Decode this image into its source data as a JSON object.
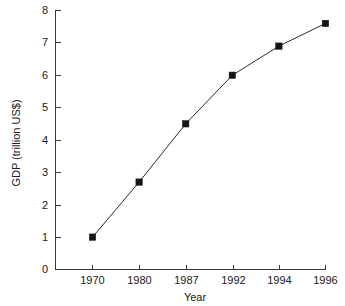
{
  "chart_data": {
    "type": "line",
    "title": "",
    "xlabel": "Year",
    "ylabel": "GDP (trillion US$)",
    "categories": [
      "1970",
      "1980",
      "1987",
      "1992",
      "1994",
      "1996"
    ],
    "values": [
      1.0,
      2.7,
      4.5,
      6.0,
      6.9,
      7.6
    ],
    "series": [
      {
        "name": "GDP",
        "values": [
          1.0,
          2.7,
          4.5,
          6.0,
          6.9,
          7.6
        ]
      }
    ],
    "x_tick_labels": [
      "1970",
      "1980",
      "1987",
      "1992",
      "1994",
      "1996"
    ],
    "y_tick_labels": [
      "0",
      "1",
      "2",
      "3",
      "4",
      "5",
      "6",
      "7",
      "8"
    ],
    "y_ticks": [
      0,
      1,
      2,
      3,
      4,
      5,
      6,
      7,
      8
    ],
    "ylim": [
      0,
      8
    ],
    "grid": false,
    "legend": false,
    "marker": "filled-square",
    "line_color": "#2b2b2b",
    "marker_color": "#151515",
    "axis_color": "#3a3a3a",
    "background_color": "#ffffff"
  },
  "axes": {
    "x_title": "Year",
    "y_title": "GDP (trillion US$)"
  },
  "ticks": {
    "y": [
      {
        "label": "8",
        "value": 8
      },
      {
        "label": "7",
        "value": 7
      },
      {
        "label": "6",
        "value": 6
      },
      {
        "label": "5",
        "value": 5
      },
      {
        "label": "4",
        "value": 4
      },
      {
        "label": "3",
        "value": 3
      },
      {
        "label": "2",
        "value": 2
      },
      {
        "label": "1",
        "value": 1
      },
      {
        "label": "0",
        "value": 0
      }
    ],
    "x": [
      {
        "label": "1970"
      },
      {
        "label": "1980"
      },
      {
        "label": "1987"
      },
      {
        "label": "1992"
      },
      {
        "label": "1994"
      },
      {
        "label": "1996"
      }
    ]
  }
}
